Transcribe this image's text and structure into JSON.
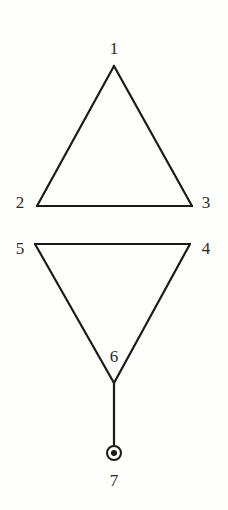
{
  "diagram": {
    "type": "graph",
    "colors": {
      "background": "#fefefc",
      "stroke": "#1a1a1a",
      "label": "#2a2a2a"
    },
    "nodes": [
      {
        "id": "1",
        "label": "1",
        "x": 114,
        "y": 66
      },
      {
        "id": "2",
        "label": "2",
        "x": 37,
        "y": 206
      },
      {
        "id": "3",
        "label": "3",
        "x": 192,
        "y": 206
      },
      {
        "id": "4",
        "label": "4",
        "x": 190,
        "y": 244
      },
      {
        "id": "5",
        "label": "5",
        "x": 35,
        "y": 244
      },
      {
        "id": "6",
        "label": "6",
        "x": 114,
        "y": 383
      },
      {
        "id": "7",
        "label": "7",
        "x": 114,
        "y": 453,
        "marker": "circled-dot"
      }
    ],
    "edges": [
      {
        "from": "1",
        "to": "2"
      },
      {
        "from": "1",
        "to": "3"
      },
      {
        "from": "2",
        "to": "3"
      },
      {
        "from": "5",
        "to": "4"
      },
      {
        "from": "5",
        "to": "6"
      },
      {
        "from": "4",
        "to": "6"
      },
      {
        "from": "6",
        "to": "7"
      }
    ],
    "labels": {
      "n1": "1",
      "n2": "2",
      "n3": "3",
      "n4": "4",
      "n5": "5",
      "n6": "6",
      "n7": "7"
    }
  }
}
